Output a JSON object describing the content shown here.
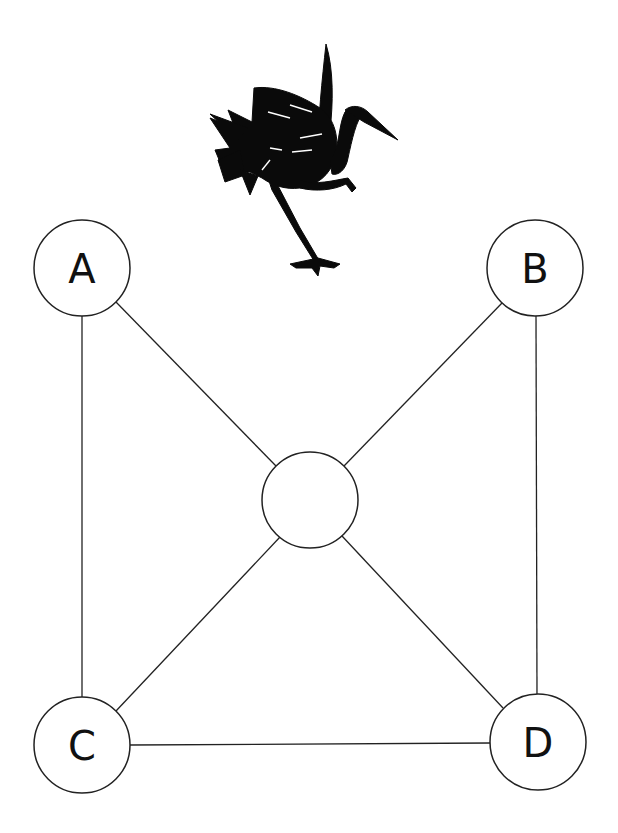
{
  "diagram": {
    "type": "graph",
    "illustration": "crane-bird-silhouette",
    "nodes": [
      {
        "id": "A",
        "label": "A",
        "cx": 82,
        "cy": 268,
        "r": 48
      },
      {
        "id": "B",
        "label": "B",
        "cx": 535,
        "cy": 268,
        "r": 48
      },
      {
        "id": "center",
        "label": "",
        "cx": 310,
        "cy": 500,
        "r": 48
      },
      {
        "id": "C",
        "label": "C",
        "cx": 82,
        "cy": 745,
        "r": 48
      },
      {
        "id": "D",
        "label": "D",
        "cx": 538,
        "cy": 742,
        "r": 48
      }
    ],
    "edges": [
      [
        "A",
        "C"
      ],
      [
        "A",
        "center"
      ],
      [
        "B",
        "center"
      ],
      [
        "B",
        "D"
      ],
      [
        "C",
        "center"
      ],
      [
        "D",
        "center"
      ],
      [
        "C",
        "D"
      ]
    ],
    "colors": {
      "stroke": "#222222",
      "fill": "#ffffff",
      "bird": "#0a0a0a"
    }
  }
}
